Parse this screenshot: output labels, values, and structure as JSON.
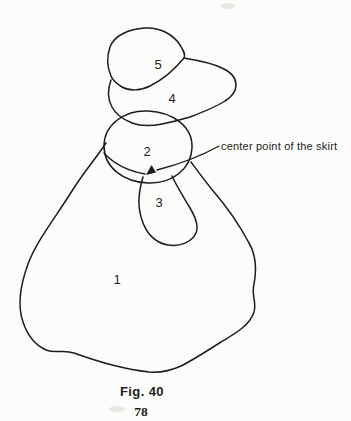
{
  "colors": {
    "ink": "#1c1c1c",
    "paper": "#fcfcfa"
  },
  "figure": {
    "caption": "Fig. 40",
    "annotation": "center point of the skirt",
    "parts": [
      {
        "label": "1"
      },
      {
        "label": "2"
      },
      {
        "label": "3"
      },
      {
        "label": "4"
      },
      {
        "label": "5"
      }
    ]
  },
  "page": {
    "number": "78"
  }
}
